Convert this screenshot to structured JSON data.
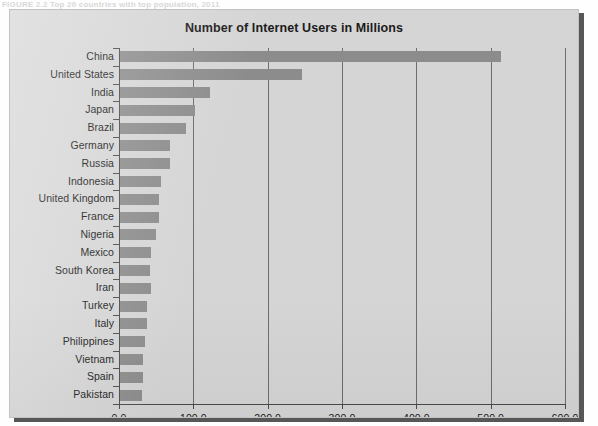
{
  "figure": {
    "caption_fragment": "FIGURE 2.2   Top 20 countries with top population, 2011",
    "title": "Number of Internet Users in Millions"
  },
  "axes": {
    "x_tick_labels": [
      "0.0",
      "100.0",
      "200.0",
      "300.0",
      "400.0",
      "500.0",
      "600.0"
    ],
    "x_tick_values": [
      0,
      100,
      200,
      300,
      400,
      500,
      600
    ],
    "y_tick_labels": [
      "China",
      "United States",
      "India",
      "Japan",
      "Brazil",
      "Germany",
      "Russia",
      "Indonesia",
      "United Kingdom",
      "France",
      "Nigeria",
      "Mexico",
      "South Korea",
      "Iran",
      "Turkey",
      "Italy",
      "Philippines",
      "Vietnam",
      "Spain",
      "Pakistan"
    ]
  },
  "colors": {
    "panel_background": "#d5d5d5",
    "bar_fill": "#8c8c8c",
    "axis_line": "#4a4a4a",
    "gridline": "#6e6e6e",
    "text": "#141414",
    "shadow": "#3a3a3a"
  },
  "chart_data": {
    "type": "bar",
    "orientation": "horizontal",
    "title": "Number of Internet Users in Millions",
    "xlabel": "",
    "ylabel": "",
    "xlim": [
      0,
      600
    ],
    "grid": true,
    "legend": false,
    "categories": [
      "China",
      "United States",
      "India",
      "Japan",
      "Brazil",
      "Germany",
      "Russia",
      "Indonesia",
      "United Kingdom",
      "France",
      "Nigeria",
      "Mexico",
      "South Korea",
      "Iran",
      "Turkey",
      "Italy",
      "Philippines",
      "Vietnam",
      "Spain",
      "Pakistan"
    ],
    "values": [
      513.1,
      245.2,
      121.0,
      101.2,
      88.5,
      67.5,
      67.9,
      55.0,
      52.7,
      52.2,
      48.4,
      42.0,
      40.3,
      42.0,
      36.5,
      35.8,
      33.6,
      30.5,
      31.6,
      29.1
    ],
    "ylabel_units": "millions of users"
  }
}
